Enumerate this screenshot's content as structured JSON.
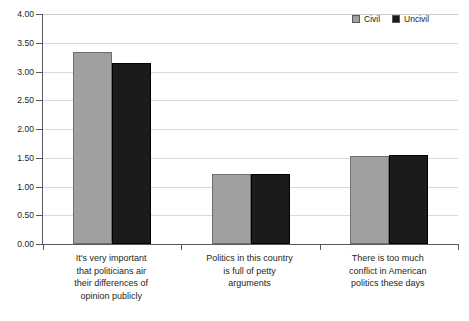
{
  "chart_data": {
    "type": "bar",
    "title": "",
    "xlabel": "",
    "ylabel": "",
    "ylim": [
      0,
      4.0
    ],
    "ytick_step": 0.5,
    "grid": true,
    "legend_position": "top-right",
    "categories": [
      "It's very important that politicians air their differences of opinion publicly",
      "Politics in this country is full of petty arguments",
      "There is too much conflict in American politics these days"
    ],
    "category_lines": [
      [
        "It's very important",
        "that politicians air",
        "their differences of",
        "opinion publicly"
      ],
      [
        "Politics in this country",
        "is full of petty",
        "arguments"
      ],
      [
        "There is too much",
        "conflict in American",
        "politics these days"
      ]
    ],
    "ytick_labels": [
      "0.00",
      "0.50",
      "1.00",
      "1.50",
      "2.00",
      "2.50",
      "3.00",
      "3.50",
      "4.00"
    ],
    "ytick_values": [
      0,
      0.5,
      1.0,
      1.5,
      2.0,
      2.5,
      3.0,
      3.5,
      4.0
    ],
    "series": [
      {
        "name": "Civil",
        "color": "#a0a0a0",
        "values": [
          3.34,
          1.22,
          1.53
        ]
      },
      {
        "name": "Uncivil",
        "color": "#1b1b1b",
        "values": [
          3.15,
          1.21,
          1.54
        ]
      }
    ]
  },
  "legend": {
    "items": [
      {
        "label": "Civil",
        "swatch": "legend-swatch-civil"
      },
      {
        "label": "Uncivil",
        "swatch": "legend-swatch-uncivil"
      }
    ]
  },
  "colors": {
    "civil": "#a0a0a0",
    "uncivil": "#1b1b1b",
    "axis": "#58595b",
    "grid": "#d9d9d9",
    "text": "#231f20",
    "background": "#ffffff"
  }
}
